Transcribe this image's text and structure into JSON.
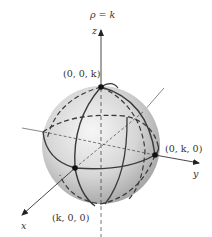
{
  "figure": {
    "title": "ρ = k",
    "axes": {
      "x_label": "x",
      "y_label": "y",
      "z_label": "z"
    },
    "points": [
      {
        "id": "z-intercept",
        "label": "(0, 0, k)"
      },
      {
        "id": "y-intercept",
        "label": "(0, k, 0)"
      },
      {
        "id": "x-intercept",
        "label": "(k, 0, 0)"
      }
    ],
    "colors": {
      "sphere_light": "#f2f2f2",
      "sphere_mid": "#c9c9c9",
      "sphere_dark": "#8f8f8f",
      "curve": "#3a3a3a",
      "axis": "#333333"
    }
  }
}
